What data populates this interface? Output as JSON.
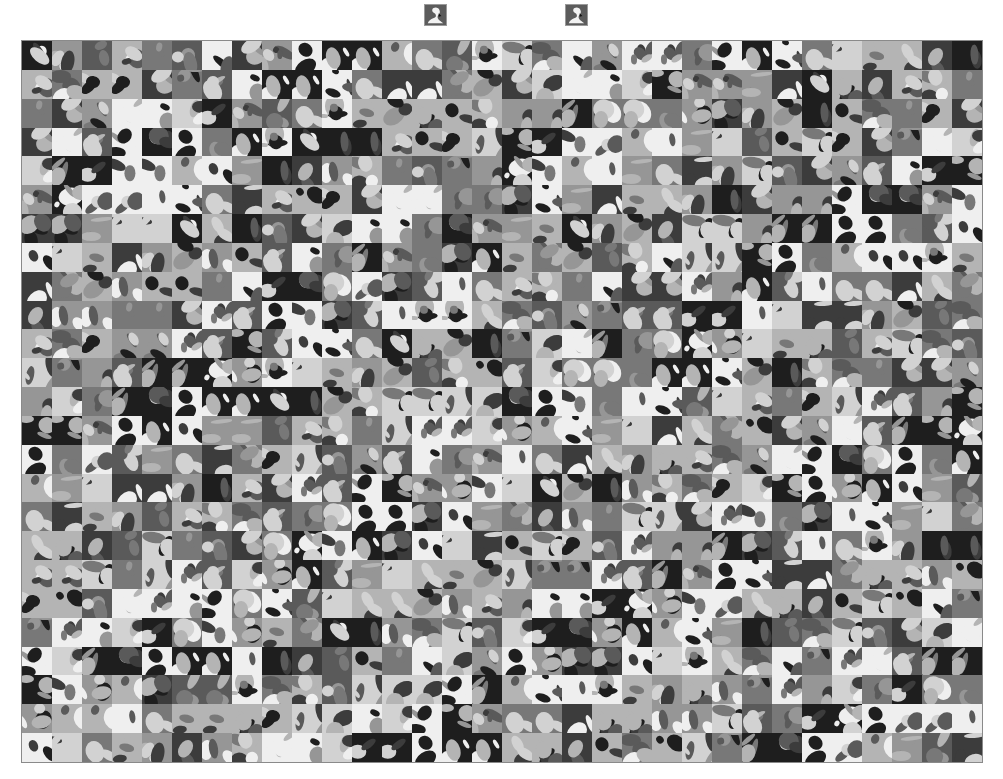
{
  "query": {
    "thumbnails": [
      {
        "label": "swan",
        "icon": "swan-thumbnail",
        "left": 424
      },
      {
        "label": "swan",
        "icon": "swan-thumbnail",
        "left": 565
      }
    ]
  },
  "mosaic": {
    "description": "Grayscale grid of bird image thumbnails",
    "columns": 32,
    "rows": 25,
    "left": 21,
    "top": 40,
    "width": 962,
    "height": 723,
    "border_color": "#8a8a8a",
    "tone_palette": [
      "#1e1e1e",
      "#3c3c3c",
      "#5a5a5a",
      "#787878",
      "#969696",
      "#b4b4b4",
      "#d2d2d2",
      "#efefef"
    ],
    "recurring_subjects": [
      "swan",
      "eggs",
      "eagle",
      "parrot",
      "penguin",
      "owl",
      "heron",
      "flamingo",
      "hummingbird",
      "toucan",
      "pelican",
      "sparrow"
    ]
  }
}
